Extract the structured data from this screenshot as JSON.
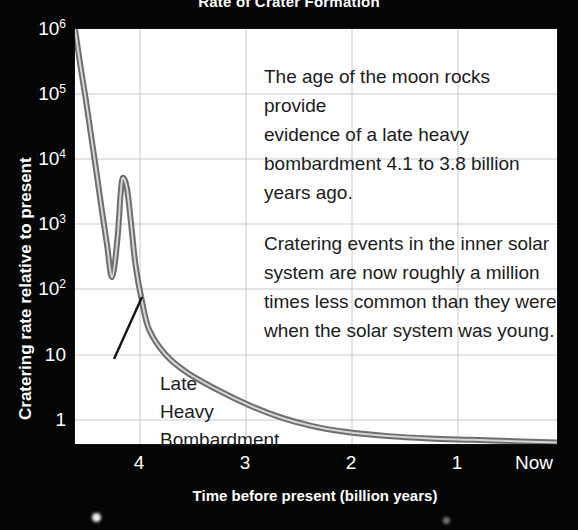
{
  "chart_data": {
    "type": "line",
    "title": "Rate of Crater Formation",
    "xlabel": "Time before present (billion years)",
    "ylabel": "Cratering rate relative to present",
    "xlim": [
      4.55,
      0
    ],
    "ylim": [
      1,
      1000000
    ],
    "yscale": "log",
    "grid": true,
    "legend": "none",
    "xticks": [
      "4",
      "3",
      "2",
      "1",
      "Now"
    ],
    "xtick_values": [
      4,
      3,
      2,
      1,
      0
    ],
    "yticks": [
      "1",
      "10",
      "10^2",
      "10^3",
      "10^4",
      "10^5",
      "10^6"
    ],
    "ytick_values": [
      1,
      10,
      100,
      1000,
      10000,
      100000,
      1000000
    ],
    "series": [
      {
        "name": "Cratering rate",
        "x": [
          4.55,
          4.5,
          4.45,
          4.4,
          4.35,
          4.3,
          4.25,
          4.2,
          4.15,
          4.12,
          4.1,
          4.06,
          4.02,
          3.98,
          3.92,
          3.85,
          3.7,
          3.5,
          3.2,
          2.9,
          2.6,
          2.3,
          2.0,
          1.6,
          1.2,
          0.8,
          0.4,
          0.0
        ],
        "y": [
          1000000,
          300000,
          100000,
          30000,
          9000,
          2600,
          800,
          260,
          900,
          4000,
          7000,
          5000,
          1500,
          400,
          120,
          45,
          20,
          11,
          6,
          3.6,
          2.4,
          1.8,
          1.5,
          1.3,
          1.2,
          1.15,
          1.1,
          1.05
        ]
      }
    ],
    "annotations": [
      {
        "name": "moon-rocks-note",
        "text": "The age of the moon rocks provide\nevidence of a late heavy\nbombardment 4.1 to 3.8 billion\nyears ago."
      },
      {
        "name": "cratering-rate-note",
        "text": "Cratering events in the inner solar\nsystem are now roughly a million\ntimes less common than they were\nwhen the solar system was young."
      },
      {
        "name": "late-heavy-bombardment-callout",
        "text": "Late\nHeavy\nBombardment",
        "points_to": {
          "x": 4.13,
          "y": 600
        }
      }
    ],
    "colors": {
      "background": "#050505",
      "panel": "#ffffff",
      "axis_text": "#ffffff",
      "curve": "#8a8a8a",
      "curve_highlight": "#d8d8d8",
      "grid": "#c9c9c9",
      "annotation_text": "#1b1b1b"
    }
  },
  "figure": {
    "title": "Rate of Crater Formation",
    "xlabel": "Time before present (billion years)",
    "ylabel": "Cratering rate relative to present"
  },
  "yticks": [
    {
      "mantissa": "10",
      "exponent": "6",
      "top": 18
    },
    {
      "mantissa": "10",
      "exponent": "5",
      "top": 83
    },
    {
      "mantissa": "10",
      "exponent": "4",
      "top": 148
    },
    {
      "mantissa": "10",
      "exponent": "3",
      "top": 213
    },
    {
      "mantissa": "10",
      "exponent": "2",
      "top": 278
    },
    {
      "mantissa": "10",
      "exponent": "",
      "top": 344
    },
    {
      "mantissa": "1",
      "exponent": "",
      "top": 409
    }
  ],
  "xticks": [
    {
      "label": "4",
      "left": 139
    },
    {
      "label": "3",
      "left": 245
    },
    {
      "label": "2",
      "left": 351
    },
    {
      "label": "1",
      "left": 457
    },
    {
      "label": "Now",
      "left": 534
    }
  ],
  "annotations": {
    "note_one": "The age of the moon rocks provide\nevidence of a late heavy\nbombardment 4.1 to 3.8 billion\nyears ago.",
    "note_two": "Cratering events in the inner solar\nsystem are now roughly a million\ntimes less common than they were\nwhen the solar system was young.",
    "callout": "Late\nHeavy\nBombardment"
  },
  "stars": [
    {
      "left": 96,
      "top": 517,
      "size": 9,
      "opacity": 0.95
    },
    {
      "left": 446,
      "top": 520,
      "size": 7,
      "opacity": 0.45
    }
  ]
}
